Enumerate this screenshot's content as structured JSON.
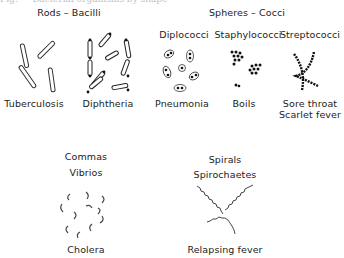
{
  "caption": "Fig. — Bacterial organisms by shape",
  "groups": {
    "rods": {
      "title": "Rods – Bacilli",
      "examples": [
        "Tuberculosis",
        "Diphtheria"
      ]
    },
    "spheres": {
      "title": "Spheres – Cocci",
      "types": [
        {
          "name": "Diplococci",
          "disease": "Pneumonia"
        },
        {
          "name": "Staphylococci",
          "disease": "Boils"
        },
        {
          "name": "Streptococci",
          "disease": "Sore throat",
          "disease2": "Scarlet fever"
        }
      ]
    },
    "commas": {
      "title": "Commas",
      "subtitle": "Vibrios",
      "disease": "Cholera"
    },
    "spirals": {
      "title": "Spirals",
      "subtitle": "Spirochaetes",
      "disease": "Relapsing fever"
    }
  }
}
